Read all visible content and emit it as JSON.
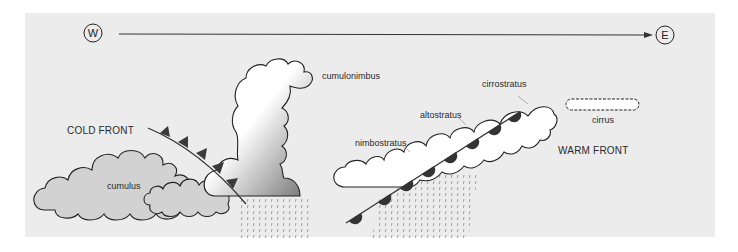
{
  "diagram": {
    "type": "weather-fronts-cross-section",
    "compass": {
      "west": "W",
      "east": "E",
      "arrow_direction": "west-to-east"
    },
    "fronts": [
      {
        "name": "cold_front",
        "label": "COLD FRONT",
        "symbol": "triangles"
      },
      {
        "name": "warm_front",
        "label": "WARM FRONT",
        "symbol": "semicircles"
      }
    ],
    "clouds": [
      {
        "id": "cumulus",
        "label": "cumulus"
      },
      {
        "id": "cumulonimbus",
        "label": "cumulonimbus"
      },
      {
        "id": "nimbostratus",
        "label": "nimbostratus"
      },
      {
        "id": "altostratus",
        "label": "altostratus"
      },
      {
        "id": "cirrostratus",
        "label": "cirrostratus"
      },
      {
        "id": "cirrus",
        "label": "cirrus"
      }
    ],
    "colors": {
      "panel_bg": "#ececec",
      "line": "#222222",
      "cumulus_fill": "#d2d2d2",
      "cloud_fill": "#ffffff",
      "front_symbol": "#3a3a3a",
      "rain": "#8a8a8a"
    }
  }
}
